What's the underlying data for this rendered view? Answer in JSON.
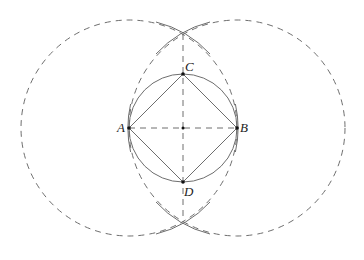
{
  "diagram": {
    "type": "geometric-construction",
    "points": {
      "A": {
        "label": "A",
        "x": 129,
        "y": 128
      },
      "B": {
        "label": "B",
        "x": 237,
        "y": 128
      },
      "C": {
        "label": "C",
        "x": 183,
        "y": 74
      },
      "D": {
        "label": "D",
        "x": 183,
        "y": 182
      },
      "O": {
        "label": "",
        "x": 183,
        "y": 128
      }
    },
    "big_circle_radius": 108,
    "small_circle_radius": 54,
    "colors": {
      "stroke": "#6e6e6e",
      "dashed": "#6e6e6e",
      "point": "#111111"
    }
  }
}
